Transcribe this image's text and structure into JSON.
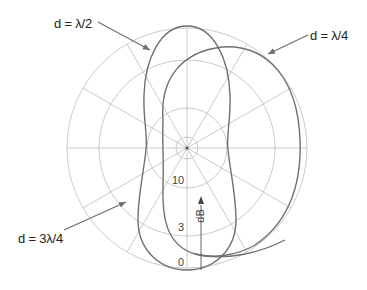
{
  "diagram": {
    "type": "polar radiation pattern",
    "center": [
      187,
      148
    ],
    "rings_radii_px": [
      11,
      40,
      88,
      120
    ],
    "spoke_step_deg": 30,
    "colors": {
      "grid": "#bdbdbd",
      "curve": "#6e6e6e",
      "text": "#222222",
      "arrow": "#6e6e6e"
    }
  },
  "labels": {
    "half_wave": "d = λ/2",
    "quarter_wave": "d = λ/4",
    "three_quarter_wave": "d = 3λ/4"
  },
  "scale": {
    "unit": "dB",
    "ticks": [
      "10",
      "3",
      "0"
    ]
  },
  "curves": [
    {
      "name": "d = λ/2",
      "description": "symmetric figure-eight along vertical axis"
    },
    {
      "name": "d = λ/4",
      "description": "cardioid-like lobe toward right"
    },
    {
      "name": "d = 3λ/4",
      "description": "lobe shape pointed to by lower-left arrow"
    }
  ]
}
